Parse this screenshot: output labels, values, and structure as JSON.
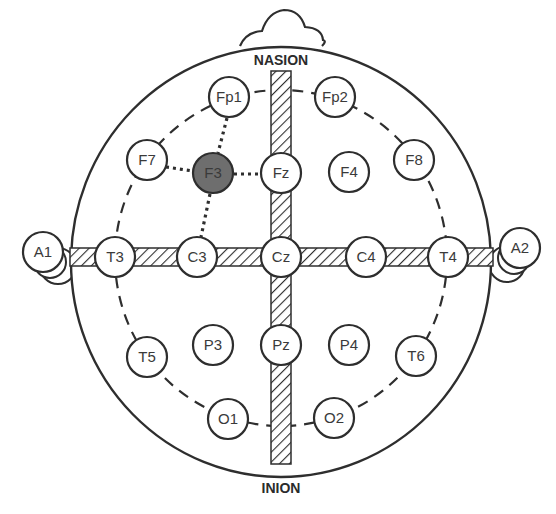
{
  "landmarks": {
    "nasion": "NASION",
    "inion": "INION"
  },
  "colors": {
    "stroke": "#2e2e2e",
    "highlight_fill": "#6e6e6e",
    "electrode_fill": "#ffffff",
    "strip_hatch": "#2e2e2e"
  },
  "highlighted_electrode": "F3",
  "electrodes": [
    {
      "id": "Fp1",
      "label": "Fp1",
      "x": 229,
      "y": 97
    },
    {
      "id": "Fp2",
      "label": "Fp2",
      "x": 335,
      "y": 97
    },
    {
      "id": "F7",
      "label": "F7",
      "x": 147,
      "y": 160
    },
    {
      "id": "F3",
      "label": "F3",
      "x": 213,
      "y": 173
    },
    {
      "id": "Fz",
      "label": "Fz",
      "x": 281,
      "y": 173
    },
    {
      "id": "F4",
      "label": "F4",
      "x": 349,
      "y": 172
    },
    {
      "id": "F8",
      "label": "F8",
      "x": 414,
      "y": 160
    },
    {
      "id": "A1",
      "label": "A1",
      "x": 43,
      "y": 252
    },
    {
      "id": "T3",
      "label": "T3",
      "x": 115,
      "y": 257
    },
    {
      "id": "C3",
      "label": "C3",
      "x": 197,
      "y": 257
    },
    {
      "id": "Cz",
      "label": "Cz",
      "x": 281,
      "y": 257
    },
    {
      "id": "C4",
      "label": "C4",
      "x": 366,
      "y": 257
    },
    {
      "id": "T4",
      "label": "T4",
      "x": 448,
      "y": 257
    },
    {
      "id": "A2",
      "label": "A2",
      "x": 520,
      "y": 248
    },
    {
      "id": "T5",
      "label": "T5",
      "x": 147,
      "y": 357
    },
    {
      "id": "P3",
      "label": "P3",
      "x": 213,
      "y": 345
    },
    {
      "id": "Pz",
      "label": "Pz",
      "x": 281,
      "y": 345
    },
    {
      "id": "P4",
      "label": "P4",
      "x": 349,
      "y": 345
    },
    {
      "id": "T6",
      "label": "T6",
      "x": 416,
      "y": 356
    },
    {
      "id": "O1",
      "label": "O1",
      "x": 228,
      "y": 419
    },
    {
      "id": "O2",
      "label": "O2",
      "x": 334,
      "y": 418
    }
  ]
}
